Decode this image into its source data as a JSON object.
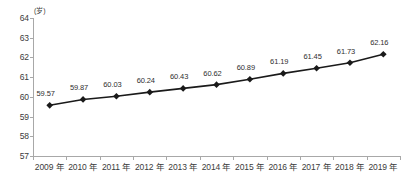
{
  "chart_data": {
    "type": "line",
    "title": "",
    "xlabel": "",
    "ylabel": "",
    "yunit": "(岁)",
    "ylim": [
      57,
      64
    ],
    "ytick_step": 1,
    "yticks": [
      "64",
      "63",
      "62",
      "61",
      "60",
      "59",
      "58",
      "57"
    ],
    "grid": false,
    "legend": "none",
    "marker": "diamond",
    "marker_color": "#1a1a1a",
    "line_color": "#1a1a1a",
    "categories": [
      "2009 年",
      "2010 年",
      "2011 年",
      "2012 年",
      "2013 年",
      "2014 年",
      "2015 年",
      "2016 年",
      "2017 年",
      "2018 年",
      "2019 年"
    ],
    "values": [
      59.57,
      59.87,
      60.03,
      60.24,
      60.43,
      60.62,
      60.89,
      61.19,
      61.45,
      61.73,
      62.16
    ],
    "point_labels": [
      "59.57",
      "59.87",
      "60.03",
      "60.24",
      "60.43",
      "60.62",
      "60.89",
      "61.19",
      "61.45",
      "61.73",
      "62.16"
    ]
  },
  "axis_color": "#a8a8a8",
  "text_color": "#3b3b3b"
}
